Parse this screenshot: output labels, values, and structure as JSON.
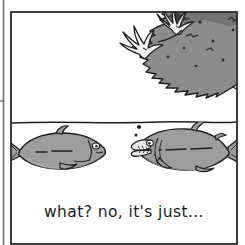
{
  "comic": {
    "panel": {
      "label": "comic panel",
      "border_color": "#2b2b2b",
      "background_color": "#ffffff",
      "prev_panel_edge_label": "previous panel edge"
    },
    "scene": {
      "waterline_label": "water surface line",
      "above_water_label": "air above water",
      "below_water_label": "underwater"
    },
    "bird": {
      "label": "diving bird",
      "body_color": "#8c8c8c",
      "body_shadow_color": "#6f6f6f",
      "talon_color": "#f2f2f2",
      "outline_color": "#1f1f1f",
      "talon_count": "2"
    },
    "fish_left": {
      "label": "left fish",
      "body_color": "#9d9d9d",
      "belly_color": "#b8b8b8",
      "outline_color": "#1f1f1f",
      "facing": "right",
      "mouth": "closed"
    },
    "fish_right": {
      "label": "right fish talking",
      "body_color": "#9d9d9d",
      "belly_color": "#bcbcbc",
      "outline_color": "#1f1f1f",
      "facing": "left",
      "mouth": "open",
      "bubble_count": "2"
    },
    "caption": {
      "text": "what? no, it's just...",
      "color": "#1a1a1a"
    }
  }
}
